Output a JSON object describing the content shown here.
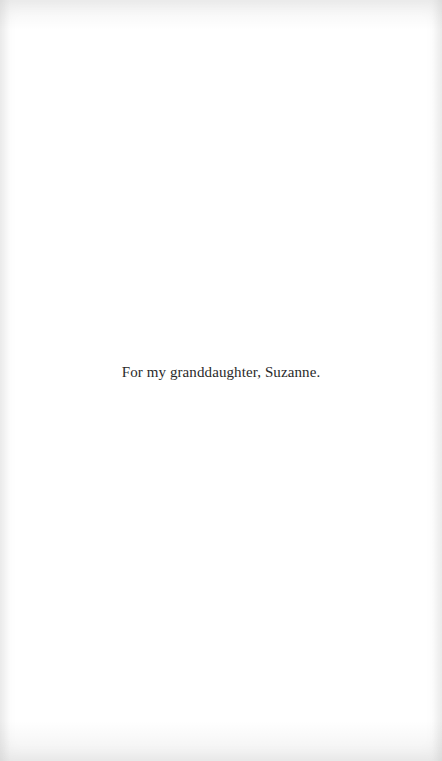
{
  "page": {
    "background": "#ffffff",
    "text_color": "#2a2a2a"
  },
  "dedication": {
    "text": "For my granddaughter, Suzanne."
  }
}
